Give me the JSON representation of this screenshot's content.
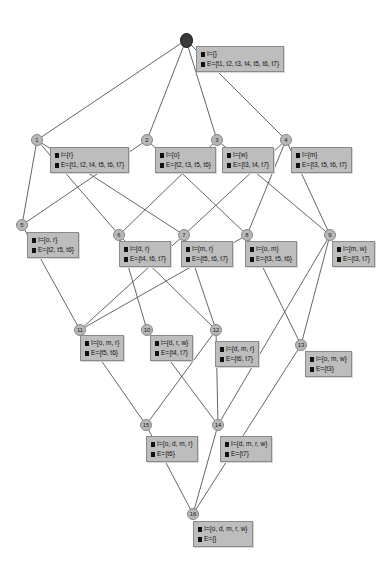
{
  "lattice": {
    "nodes": [
      {
        "id": "0",
        "label": "",
        "intent": "I={}",
        "extent": "E={t1, t2, t3, t4, t5, t6, t7}",
        "cx": 186,
        "cy": 40,
        "bx": 196,
        "by": 46
      },
      {
        "id": "1",
        "label": "1",
        "intent": "I={r}",
        "extent": "E={t1, t2, t4, t5, t6, t7}",
        "cx": 37,
        "cy": 140,
        "bx": 50,
        "by": 147
      },
      {
        "id": "2",
        "label": "2",
        "intent": "I={o}",
        "extent": "E={t2, t3, t5, t6}",
        "cx": 147,
        "cy": 140,
        "bx": 155,
        "by": 147
      },
      {
        "id": "3",
        "label": "3",
        "intent": "I={w}",
        "extent": "E={t3, t4, t7}",
        "cx": 217,
        "cy": 140,
        "bx": 222,
        "by": 147
      },
      {
        "id": "4",
        "label": "4",
        "intent": "I={m}",
        "extent": "E={t3, t5, t6, t7}",
        "cx": 286,
        "cy": 140,
        "bx": 291,
        "by": 147
      },
      {
        "id": "5",
        "label": "5",
        "intent": "I={o, r}",
        "extent": "E={t2, t5, t6}",
        "cx": 22,
        "cy": 225,
        "bx": 27,
        "by": 232
      },
      {
        "id": "6",
        "label": "6",
        "intent": "I={d, r}",
        "extent": "E={t4, t6, t7}",
        "cx": 119,
        "cy": 235,
        "bx": 119,
        "by": 241
      },
      {
        "id": "7",
        "label": "7",
        "intent": "I={m, r}",
        "extent": "E={t5, t6, t7}",
        "cx": 184,
        "cy": 235,
        "bx": 181,
        "by": 241
      },
      {
        "id": "8",
        "label": "8",
        "intent": "I={o, m}",
        "extent": "E={t3, t5, t6}",
        "cx": 247,
        "cy": 235,
        "bx": 245,
        "by": 241
      },
      {
        "id": "9",
        "label": "9",
        "intent": "I={m, w}",
        "extent": "E={t3, t7}",
        "cx": 330,
        "cy": 235,
        "bx": 332,
        "by": 241
      },
      {
        "id": "11",
        "label": "11",
        "intent": "I={o, m, r}",
        "extent": "E={t5, t6}",
        "cx": 80,
        "cy": 330,
        "bx": 80,
        "by": 335
      },
      {
        "id": "10",
        "label": "10",
        "intent": "I={d, r, w}",
        "extent": "E={t4, t7}",
        "cx": 147,
        "cy": 330,
        "bx": 150,
        "by": 335
      },
      {
        "id": "12",
        "label": "12",
        "intent": "I={d, m, r}",
        "extent": "E={t6, t7}",
        "cx": 216,
        "cy": 330,
        "bx": 215,
        "by": 341
      },
      {
        "id": "13",
        "label": "13",
        "intent": "I={o, m, w}",
        "extent": "E={t3}",
        "cx": 301,
        "cy": 345,
        "bx": 305,
        "by": 351
      },
      {
        "id": "15",
        "label": "15",
        "intent": "I={o, d, m, r}",
        "extent": "E={t6}",
        "cx": 146,
        "cy": 425,
        "bx": 146,
        "by": 436
      },
      {
        "id": "14",
        "label": "14",
        "intent": "I={d, m, r, w}",
        "extent": "E={t7}",
        "cx": 218,
        "cy": 425,
        "bx": 220,
        "by": 436
      },
      {
        "id": "16",
        "label": "16",
        "intent": "I={o, d, m, r, w}",
        "extent": "E={}",
        "cx": 193,
        "cy": 514,
        "bx": 193,
        "by": 521
      }
    ],
    "edges": [
      [
        "0",
        "1"
      ],
      [
        "0",
        "2"
      ],
      [
        "0",
        "3"
      ],
      [
        "0",
        "4"
      ],
      [
        "1",
        "5"
      ],
      [
        "1",
        "6"
      ],
      [
        "1",
        "7"
      ],
      [
        "2",
        "5"
      ],
      [
        "2",
        "8"
      ],
      [
        "3",
        "6"
      ],
      [
        "3",
        "9"
      ],
      [
        "4",
        "7"
      ],
      [
        "4",
        "8"
      ],
      [
        "4",
        "9"
      ],
      [
        "5",
        "11"
      ],
      [
        "6",
        "10"
      ],
      [
        "6",
        "12"
      ],
      [
        "7",
        "11"
      ],
      [
        "7",
        "12"
      ],
      [
        "8",
        "11"
      ],
      [
        "8",
        "13"
      ],
      [
        "9",
        "13"
      ],
      [
        "9",
        "14"
      ],
      [
        "10",
        "14"
      ],
      [
        "11",
        "15"
      ],
      [
        "12",
        "15"
      ],
      [
        "12",
        "14"
      ],
      [
        "13",
        "16"
      ],
      [
        "15",
        "16"
      ],
      [
        "14",
        "16"
      ]
    ]
  }
}
